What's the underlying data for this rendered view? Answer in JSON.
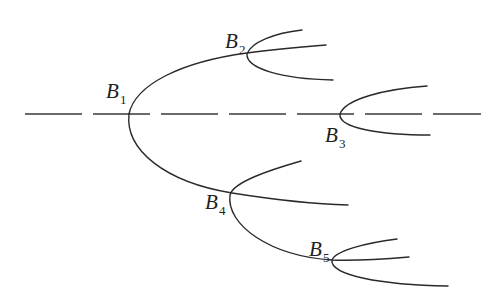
{
  "diagram": {
    "type": "bifurcation-tree",
    "axis": {
      "style": "dashed",
      "y": 114,
      "x_start": 25,
      "x_end": 481
    },
    "stroke_color": "#2a2a2a",
    "nodes": [
      {
        "id": "B1",
        "letter": "B",
        "sub": "1",
        "vertex": [
          129,
          114
        ]
      },
      {
        "id": "B2",
        "letter": "B",
        "sub": "2",
        "vertex": [
          247,
          54
        ]
      },
      {
        "id": "B3",
        "letter": "B",
        "sub": "3",
        "vertex": [
          340,
          114
        ]
      },
      {
        "id": "B4",
        "letter": "B",
        "sub": "4",
        "vertex": [
          230,
          195
        ]
      },
      {
        "id": "B5",
        "letter": "B",
        "sub": "5",
        "vertex": [
          332,
          260
        ]
      }
    ],
    "branches": [
      {
        "from": "B1",
        "to": "B2",
        "description": "upper branch of B1 through B2"
      },
      {
        "from": "B1",
        "to": "B4",
        "description": "lower branch of B1 through B4"
      },
      {
        "from": "B2",
        "description": "new parabola opening at B2"
      },
      {
        "from": "B3",
        "description": "parabola opening on the axis at B3"
      },
      {
        "from": "B4",
        "to": "B5",
        "description": "parabola at B4, lower arm through B5"
      },
      {
        "from": "B5",
        "description": "parabola opening at B5"
      }
    ]
  }
}
